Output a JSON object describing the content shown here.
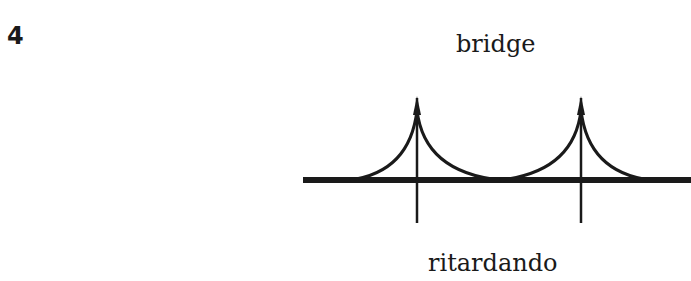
{
  "figure": {
    "number": "4",
    "top_label": "bridge",
    "bottom_label": "ritardando",
    "ink_color": "#1a1a1a"
  }
}
